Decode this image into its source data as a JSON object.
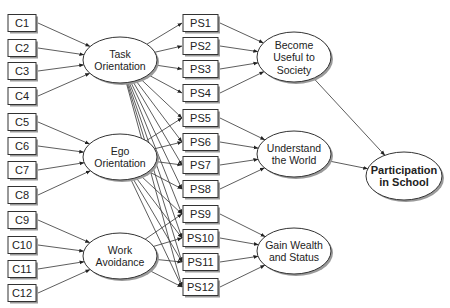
{
  "diagram": {
    "type": "path-model",
    "indicators": [
      {
        "id": "C1",
        "label": "C1",
        "y": 23,
        "target": "task"
      },
      {
        "id": "C2",
        "label": "C2",
        "y": 48,
        "target": "task"
      },
      {
        "id": "C3",
        "label": "C3",
        "y": 71,
        "target": "task"
      },
      {
        "id": "C4",
        "label": "C4",
        "y": 96,
        "target": "task"
      },
      {
        "id": "C5",
        "label": "C5",
        "y": 122,
        "target": "ego"
      },
      {
        "id": "C6",
        "label": "C6",
        "y": 146,
        "target": "ego"
      },
      {
        "id": "C7",
        "label": "C7",
        "y": 170,
        "target": "ego"
      },
      {
        "id": "C8",
        "label": "C8",
        "y": 195,
        "target": "ego"
      },
      {
        "id": "C9",
        "label": "C9",
        "y": 220,
        "target": "work"
      },
      {
        "id": "C10",
        "label": "C10",
        "y": 245,
        "target": "work"
      },
      {
        "id": "C11",
        "label": "C11",
        "y": 269,
        "target": "work"
      },
      {
        "id": "C12",
        "label": "C12",
        "y": 293,
        "target": "work"
      }
    ],
    "orientations": [
      {
        "id": "task",
        "lines": [
          "Task",
          "Orientation"
        ],
        "cx": 120,
        "cy": 60
      },
      {
        "id": "ego",
        "lines": [
          "Ego",
          "Orientation"
        ],
        "cx": 120,
        "cy": 157
      },
      {
        "id": "work",
        "lines": [
          "Work",
          "Avoidance"
        ],
        "cx": 120,
        "cy": 256
      }
    ],
    "purposes": [
      {
        "id": "PS1",
        "label": "PS1",
        "y": 23,
        "target": "useful"
      },
      {
        "id": "PS2",
        "label": "PS2",
        "y": 46,
        "target": "useful"
      },
      {
        "id": "PS3",
        "label": "PS3",
        "y": 69,
        "target": "useful"
      },
      {
        "id": "PS4",
        "label": "PS4",
        "y": 93,
        "target": "useful"
      },
      {
        "id": "PS5",
        "label": "PS5",
        "y": 118,
        "target": "world"
      },
      {
        "id": "PS6",
        "label": "PS6",
        "y": 142,
        "target": "world"
      },
      {
        "id": "PS7",
        "label": "PS7",
        "y": 165,
        "target": "world"
      },
      {
        "id": "PS8",
        "label": "PS8",
        "y": 189,
        "target": "world"
      },
      {
        "id": "PS9",
        "label": "PS9",
        "y": 214,
        "target": "wealth"
      },
      {
        "id": "PS10",
        "label": "PS10",
        "y": 238,
        "target": "wealth"
      },
      {
        "id": "PS11",
        "label": "PS11",
        "y": 262,
        "target": "wealth"
      },
      {
        "id": "PS12",
        "label": "PS12",
        "y": 287,
        "target": "wealth"
      }
    ],
    "purpose_factors": [
      {
        "id": "useful",
        "lines": [
          "Become",
          "Useful to",
          "Society"
        ],
        "cx": 294,
        "cy": 57,
        "rx": 37,
        "ry": 25
      },
      {
        "id": "world",
        "lines": [
          "Understand",
          "the World"
        ],
        "cx": 294,
        "cy": 154,
        "rx": 37,
        "ry": 23
      },
      {
        "id": "wealth",
        "lines": [
          "Gain Wealth",
          "and Status"
        ],
        "cx": 294,
        "cy": 251,
        "rx": 37,
        "ry": 23
      }
    ],
    "outcome": {
      "id": "participation",
      "lines": [
        "Participation",
        "in School"
      ],
      "cx": 404,
      "cy": 176,
      "rx": 38,
      "ry": 24
    },
    "orientation_to_purpose_edges": [
      [
        "task",
        "PS1"
      ],
      [
        "task",
        "PS2"
      ],
      [
        "task",
        "PS3"
      ],
      [
        "task",
        "PS4"
      ],
      [
        "task",
        "PS5"
      ],
      [
        "task",
        "PS6"
      ],
      [
        "task",
        "PS7"
      ],
      [
        "task",
        "PS8"
      ],
      [
        "task",
        "PS9"
      ],
      [
        "task",
        "PS10"
      ],
      [
        "task",
        "PS11"
      ],
      [
        "task",
        "PS12"
      ],
      [
        "ego",
        "PS5"
      ],
      [
        "ego",
        "PS6"
      ],
      [
        "ego",
        "PS7"
      ],
      [
        "ego",
        "PS8"
      ],
      [
        "ego",
        "PS9"
      ],
      [
        "ego",
        "PS10"
      ],
      [
        "ego",
        "PS11"
      ],
      [
        "ego",
        "PS12"
      ],
      [
        "work",
        "PS9"
      ],
      [
        "work",
        "PS10"
      ],
      [
        "work",
        "PS11"
      ],
      [
        "work",
        "PS12"
      ]
    ],
    "factor_to_outcome_edges": [
      "useful",
      "world"
    ]
  }
}
